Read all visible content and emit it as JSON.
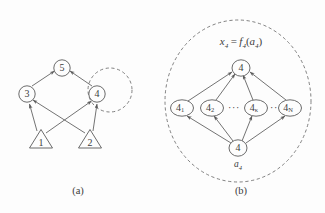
{
  "figure": {
    "background_color": "#fdfdfd",
    "stroke_color": "#5a5a5a",
    "text_color": "#3c3c3c",
    "panels": [
      {
        "id": "panel-a",
        "caption": "(a)",
        "description": "Bayesian-network-style graph with two triangular source nodes and three circular nodes, plus a dashed self-loop region around node 4",
        "nodes": [
          {
            "id": "n1",
            "label": "1",
            "shape": "triangle",
            "cx": 41,
            "cy": 140
          },
          {
            "id": "n2",
            "label": "2",
            "shape": "triangle",
            "cx": 90,
            "cy": 140
          },
          {
            "id": "n3",
            "label": "3",
            "shape": "circle",
            "cx": 27,
            "cy": 94
          },
          {
            "id": "n4",
            "label": "4",
            "shape": "circle",
            "cx": 97,
            "cy": 94
          },
          {
            "id": "n5",
            "label": "5",
            "shape": "circle",
            "cx": 62,
            "cy": 68
          }
        ],
        "edges": [
          {
            "from": "n1",
            "to": "n3"
          },
          {
            "from": "n1",
            "to": "n4"
          },
          {
            "from": "n2",
            "to": "n3"
          },
          {
            "from": "n2",
            "to": "n4"
          },
          {
            "from": "n3",
            "to": "n5"
          },
          {
            "from": "n4",
            "to": "n5"
          }
        ],
        "dashed_region": {
          "type": "circle",
          "cx": 110,
          "cy": 90,
          "r": 22
        }
      },
      {
        "id": "panel-b",
        "caption": "(b)",
        "description": "Expanded view of node 4 inside a large dashed circle, showing the internal fan-out/fan-in structure",
        "formula": {
          "lhs_var": "x",
          "lhs_sub": "4",
          "eq": "=",
          "fn": "f",
          "fn_sub": "4",
          "open": "(",
          "arg": "a",
          "arg_sub": "4",
          "close": ")",
          "plain": "x4 = f4(a4)"
        },
        "nodes": [
          {
            "id": "top",
            "label": "4",
            "sub": "",
            "cx": 241,
            "cy": 68
          },
          {
            "id": "m1",
            "label": "4",
            "sub": "1",
            "cx": 182,
            "cy": 108
          },
          {
            "id": "m2",
            "label": "4",
            "sub": "2",
            "cx": 212,
            "cy": 108
          },
          {
            "id": "mk",
            "label": "4",
            "sub": "κ",
            "cx": 256,
            "cy": 108
          },
          {
            "id": "mN",
            "label": "4",
            "sub": "N",
            "cx": 290,
            "cy": 108
          },
          {
            "id": "bot",
            "label": "4",
            "sub": "",
            "cx": 238,
            "cy": 148
          }
        ],
        "bottom_label": {
          "var": "a",
          "sub": "4",
          "plain": "a4"
        },
        "ellipses": [
          {
            "text": "···",
            "x": 234,
            "y": 109
          },
          {
            "text": "··",
            "x": 274,
            "y": 109
          }
        ],
        "edges": [
          {
            "from": "m1",
            "to": "top"
          },
          {
            "from": "m2",
            "to": "top"
          },
          {
            "from": "mk",
            "to": "top"
          },
          {
            "from": "mN",
            "to": "top"
          },
          {
            "from": "bot",
            "to": "m1"
          },
          {
            "from": "bot",
            "to": "m2"
          },
          {
            "from": "bot",
            "to": "mk"
          },
          {
            "from": "bot",
            "to": "mN"
          }
        ],
        "dashed_region": {
          "type": "circle",
          "cx": 238,
          "cy": 101,
          "rx": 73,
          "ry": 81
        }
      }
    ]
  }
}
